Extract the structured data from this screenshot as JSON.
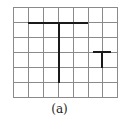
{
  "figure": {
    "caption": "(a)",
    "grid": {
      "columns": 7,
      "rows": 6,
      "x_lines": [
        13,
        28,
        43,
        58,
        73,
        88,
        102,
        117
      ],
      "y_lines": [
        7,
        22,
        37,
        52,
        67,
        82,
        97
      ],
      "line_color": "#8a8a8a"
    },
    "shapes": [
      {
        "name": "large-t",
        "stroke": "#1a1a1a",
        "segments": [
          {
            "x1": 28,
            "y1": 23,
            "x2": 88,
            "y2": 23
          },
          {
            "x1": 59,
            "y1": 23,
            "x2": 59,
            "y2": 83
          }
        ]
      },
      {
        "name": "small-t",
        "stroke": "#1a1a1a",
        "segments": [
          {
            "x1": 93,
            "y1": 52,
            "x2": 111,
            "y2": 52
          },
          {
            "x1": 102,
            "y1": 52,
            "x2": 102,
            "y2": 68
          }
        ]
      }
    ]
  }
}
